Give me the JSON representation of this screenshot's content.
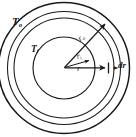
{
  "figure": {
    "kind": "radial-heat-conduction-shell-diagram",
    "background_color": "#ffffff",
    "stroke_color": "#1a1a1a",
    "center": {
      "x": 64,
      "y": 68
    }
  },
  "labels": {
    "outer_temperature": {
      "base": "T",
      "sub": "o",
      "name": "outer surface temperature"
    },
    "inner_temperature": {
      "base": "T",
      "sub": "i",
      "name": "inner surface temperature"
    },
    "outer_radius": {
      "base": "r",
      "sub": "o",
      "name": "outer radius"
    },
    "inner_radius": {
      "base": "r",
      "sub": "i",
      "name": "inner radius"
    },
    "generic_radius": {
      "base": "r",
      "sub": "",
      "name": "arbitrary radius"
    },
    "thickness_element": {
      "base": "dr",
      "sub": "",
      "name": "differential shell thickness"
    }
  },
  "circles": [
    {
      "id": "outermost",
      "radius": 66,
      "role": "outer-boundary"
    },
    {
      "id": "outer-shell-inner-edge",
      "radius": 57,
      "role": "element-outer-face"
    },
    {
      "id": "mid",
      "radius": 50,
      "role": "element-inner-face"
    },
    {
      "id": "innermost",
      "radius": 31,
      "role": "inner-boundary"
    }
  ],
  "arrows": [
    {
      "id": "arrow-ro",
      "label": "r_o",
      "from": [
        64,
        68
      ],
      "to": [
        109,
        20
      ],
      "style": "solid-arrowhead"
    },
    {
      "id": "arrow-ri",
      "label": "r_i",
      "from": [
        64,
        68
      ],
      "to": [
        92,
        60
      ],
      "style": "solid-arrowhead"
    },
    {
      "id": "arrow-r",
      "label": "r",
      "from": [
        64,
        68
      ],
      "to": [
        110,
        68
      ],
      "style": "solid-arrowhead"
    },
    {
      "id": "arrow-dr",
      "label": "dr",
      "from": [
        116,
        68
      ],
      "to": [
        108,
        68
      ],
      "style": "double-tick-span"
    }
  ]
}
